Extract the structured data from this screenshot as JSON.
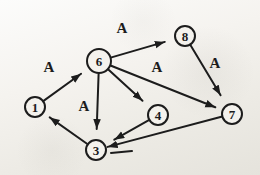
{
  "figure": {
    "kind": "directed-graph",
    "ink_color": "#1c1c1c",
    "paper_color": "#efede7",
    "nodes": [
      {
        "id": "1",
        "label": "1",
        "x": 35,
        "y": 107,
        "r": 10
      },
      {
        "id": "6",
        "label": "6",
        "x": 99,
        "y": 61,
        "r": 12
      },
      {
        "id": "8",
        "label": "8",
        "x": 185,
        "y": 36,
        "r": 10
      },
      {
        "id": "4",
        "label": "4",
        "x": 158,
        "y": 115,
        "r": 10
      },
      {
        "id": "7",
        "label": "7",
        "x": 232,
        "y": 114,
        "r": 10
      },
      {
        "id": "3",
        "label": "3",
        "x": 96,
        "y": 150,
        "r": 10
      }
    ],
    "edges": [
      {
        "from": "1",
        "to": "6",
        "label": "A",
        "label_x": 49,
        "label_y": 67,
        "gap": 10
      },
      {
        "from": "6",
        "to": "8",
        "label": "A",
        "label_x": 122,
        "label_y": 28,
        "gap": 11
      },
      {
        "from": "8",
        "to": "7",
        "label": "A",
        "label_x": 215,
        "label_y": 63,
        "gap": 12
      },
      {
        "from": "6",
        "to": "7",
        "label": "A",
        "label_x": 157,
        "label_y": 67,
        "gap": 8
      },
      {
        "from": "6",
        "to": "4",
        "label": "",
        "gap": 11
      },
      {
        "from": "6",
        "to": "3",
        "label": "A",
        "label_x": 84,
        "label_y": 106,
        "gap": 11
      },
      {
        "from": "4",
        "to": "3",
        "label": "",
        "gap": 11
      },
      {
        "from": "7",
        "to": "3",
        "label": "",
        "gap": 2,
        "tick": {
          "x1": 132,
          "y1": 151,
          "x2": 111,
          "y2": 153
        }
      },
      {
        "from": "3",
        "to": "1",
        "label": "",
        "gap": 8
      }
    ]
  }
}
